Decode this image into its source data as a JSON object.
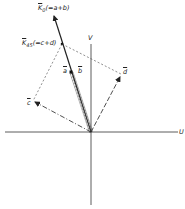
{
  "figure": {
    "axes": {
      "u_label": "U",
      "v_label": "V"
    },
    "vectors": {
      "k0_label": "K",
      "k0_sub": "0",
      "k0_expr": "(=a+b)",
      "k45_label": "K",
      "k45_sub": "45",
      "k45_expr": "(=c+d)",
      "a_label": "a",
      "b_label": "b",
      "c_label": "c",
      "d_label": "d"
    },
    "colors": {
      "line": "#222222",
      "background": "#ffffff"
    }
  }
}
